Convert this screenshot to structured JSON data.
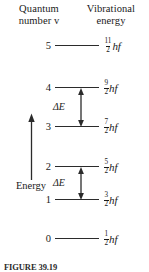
{
  "figure": {
    "type": "energy-level-diagram",
    "background_color": "#ffffff",
    "line_color": "#2b2b2b",
    "text_color": "#1a1a1a"
  },
  "headers": {
    "quantum": "Quantum\nnumber v",
    "quantum_line1": "Quantum",
    "quantum_line2": "number v",
    "vibrational": "Vibrational\nenergy",
    "vibrational_line1": "Vibrational",
    "vibrational_line2": "energy"
  },
  "axis": {
    "label": "Energy",
    "direction": "up"
  },
  "levels": [
    {
      "n": "5",
      "numerator": "11",
      "denominator": "2",
      "unit": "hf",
      "y": 46
    },
    {
      "n": "4",
      "numerator": "9",
      "denominator": "2",
      "unit": "hf",
      "y": 88
    },
    {
      "n": "3",
      "numerator": "7",
      "denominator": "2",
      "unit": "hf",
      "y": 127
    },
    {
      "n": "2",
      "numerator": "5",
      "denominator": "2",
      "unit": "hf",
      "y": 167
    },
    {
      "n": "1",
      "numerator": "3",
      "denominator": "2",
      "unit": "hf",
      "y": 200
    },
    {
      "n": "0",
      "numerator": "1",
      "denominator": "2",
      "unit": "hf",
      "y": 239
    }
  ],
  "transitions": [
    {
      "label": "ΔE",
      "from": "4",
      "to": "3"
    },
    {
      "label": "ΔE",
      "from": "2",
      "to": "1"
    }
  ],
  "caption": {
    "text": "FIGURE 39.19"
  },
  "chart_data": {
    "type": "line",
    "xlabel": "",
    "ylabel": "Energy",
    "categories": [
      "0",
      "1",
      "2",
      "3",
      "4",
      "5"
    ],
    "values": [
      0.5,
      1.5,
      2.5,
      3.5,
      4.5,
      5.5
    ],
    "tick_labels": [
      "1/2 hf",
      "3/2 hf",
      "5/2 hf",
      "7/2 hf",
      "9/2 hf",
      "11/2 hf"
    ],
    "annotations": [
      "ΔE (4 → 3)",
      "ΔE (2 → 1)"
    ],
    "grid": false,
    "legend": "none"
  }
}
